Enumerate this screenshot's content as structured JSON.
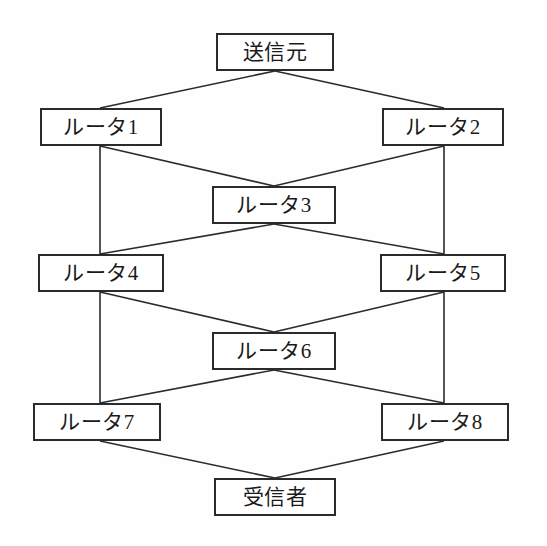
{
  "diagram": {
    "type": "network-topology-diagram",
    "title": "",
    "background_color": "#fefefe",
    "line_color": "#2b2b2b",
    "box_fill": "#ffffff",
    "text_color": "#1a1a1a",
    "nodes": [
      {
        "id": "source",
        "label": "送信元",
        "x": 216,
        "y": 33,
        "w": 118,
        "h": 38
      },
      {
        "id": "router1",
        "label": "ルータ1",
        "x": 40,
        "y": 108,
        "w": 122,
        "h": 38
      },
      {
        "id": "router2",
        "label": "ルータ2",
        "x": 382,
        "y": 108,
        "w": 122,
        "h": 38
      },
      {
        "id": "router3",
        "label": "ルータ3",
        "x": 212,
        "y": 186,
        "w": 124,
        "h": 38
      },
      {
        "id": "router4",
        "label": "ルータ4",
        "x": 38,
        "y": 254,
        "w": 126,
        "h": 38
      },
      {
        "id": "router5",
        "label": "ルータ5",
        "x": 380,
        "y": 254,
        "w": 126,
        "h": 38
      },
      {
        "id": "router6",
        "label": "ルータ6",
        "x": 212,
        "y": 332,
        "w": 124,
        "h": 38
      },
      {
        "id": "router7",
        "label": "ルータ7",
        "x": 33,
        "y": 403,
        "w": 128,
        "h": 38
      },
      {
        "id": "router8",
        "label": "ルータ8",
        "x": 381,
        "y": 403,
        "w": 128,
        "h": 38
      },
      {
        "id": "receiver",
        "label": "受信者",
        "x": 214,
        "y": 478,
        "w": 122,
        "h": 38
      }
    ],
    "edges": [
      {
        "id": "source-router1",
        "from": "source",
        "to": "router1",
        "x1": 275,
        "y1": 71,
        "x2": 100,
        "y2": 108
      },
      {
        "id": "source-router2",
        "from": "source",
        "to": "router2",
        "x1": 275,
        "y1": 71,
        "x2": 444,
        "y2": 108
      },
      {
        "id": "router1-router3",
        "from": "router1",
        "to": "router3",
        "x1": 100,
        "y1": 146,
        "x2": 274,
        "y2": 186
      },
      {
        "id": "router2-router3",
        "from": "router2",
        "to": "router3",
        "x1": 444,
        "y1": 146,
        "x2": 274,
        "y2": 186
      },
      {
        "id": "router1-router4",
        "from": "router1",
        "to": "router4",
        "x1": 100,
        "y1": 146,
        "x2": 100,
        "y2": 254
      },
      {
        "id": "router2-router5",
        "from": "router2",
        "to": "router5",
        "x1": 444,
        "y1": 146,
        "x2": 444,
        "y2": 254
      },
      {
        "id": "router3-router4",
        "from": "router3",
        "to": "router4",
        "x1": 274,
        "y1": 224,
        "x2": 100,
        "y2": 254
      },
      {
        "id": "router3-router5",
        "from": "router3",
        "to": "router5",
        "x1": 274,
        "y1": 224,
        "x2": 444,
        "y2": 254
      },
      {
        "id": "router4-router6",
        "from": "router4",
        "to": "router6",
        "x1": 100,
        "y1": 292,
        "x2": 274,
        "y2": 332
      },
      {
        "id": "router5-router6",
        "from": "router5",
        "to": "router6",
        "x1": 444,
        "y1": 292,
        "x2": 274,
        "y2": 332
      },
      {
        "id": "router4-router7",
        "from": "router4",
        "to": "router7",
        "x1": 100,
        "y1": 292,
        "x2": 100,
        "y2": 403
      },
      {
        "id": "router5-router8",
        "from": "router5",
        "to": "router8",
        "x1": 444,
        "y1": 292,
        "x2": 444,
        "y2": 403
      },
      {
        "id": "router6-router7",
        "from": "router6",
        "to": "router7",
        "x1": 274,
        "y1": 370,
        "x2": 100,
        "y2": 403
      },
      {
        "id": "router6-router8",
        "from": "router6",
        "to": "router8",
        "x1": 274,
        "y1": 370,
        "x2": 444,
        "y2": 403
      },
      {
        "id": "router7-receiver",
        "from": "router7",
        "to": "receiver",
        "x1": 100,
        "y1": 441,
        "x2": 275,
        "y2": 478
      },
      {
        "id": "router8-receiver",
        "from": "router8",
        "to": "receiver",
        "x1": 444,
        "y1": 441,
        "x2": 275,
        "y2": 478
      }
    ]
  }
}
